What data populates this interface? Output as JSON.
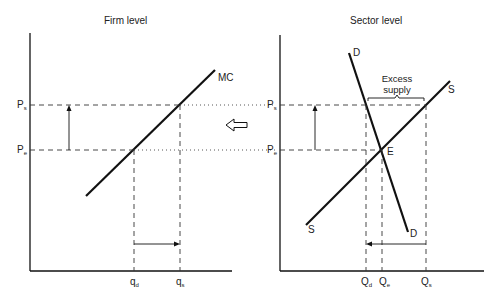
{
  "panels": {
    "firm": {
      "title": "Firm level",
      "y_labels": [
        {
          "base": "P",
          "sub": "s"
        },
        {
          "base": "P",
          "sub": "e"
        }
      ],
      "x_labels": [
        {
          "base": "q",
          "sub": "d"
        },
        {
          "base": "q",
          "sub": "s"
        }
      ],
      "curves": [
        {
          "name": "MC"
        }
      ]
    },
    "sector": {
      "title": "Sector level",
      "y_labels": [
        {
          "base": "P",
          "sub": "s"
        },
        {
          "base": "P",
          "sub": "e"
        }
      ],
      "x_labels": [
        {
          "base": "Q",
          "sub": "d"
        },
        {
          "base": "Q",
          "sub": "e"
        },
        {
          "base": "Q",
          "sub": "s"
        }
      ],
      "curves": [
        {
          "name": "D",
          "top": "D",
          "bottom": "D"
        },
        {
          "name": "S",
          "top": "S",
          "bottom": "S"
        }
      ],
      "equilibrium_label": "E",
      "annotation": {
        "line1": "Excess",
        "line2": "supply"
      }
    }
  },
  "arrow_between": "hollow-left-arrow",
  "colors": {
    "line": "#111111",
    "dash": "#333333"
  }
}
